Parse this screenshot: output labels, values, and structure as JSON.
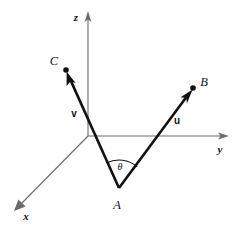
{
  "figure": {
    "kind": "3d-vector-diagram",
    "background_color": "#ffffff",
    "ink_color": "#111111",
    "axis_color": "#6b6b6b",
    "width": 240,
    "height": 228
  },
  "axes": {
    "origin": {
      "x": 88,
      "y": 136
    },
    "z": {
      "label": "z",
      "label_x": 76,
      "label_y": 21,
      "from_x": 88,
      "from_y": 136,
      "to_x": 88,
      "to_y": 14
    },
    "y": {
      "label": "y",
      "label_x": 220,
      "label_y": 153,
      "from_x": 88,
      "from_y": 136,
      "to_x": 227,
      "to_y": 136
    },
    "x": {
      "label": "x",
      "label_x": 24,
      "label_y": 220,
      "from_x": 88,
      "from_y": 136,
      "to_x": 16,
      "to_y": 209
    }
  },
  "points": {
    "A": {
      "label": "A",
      "x": 119,
      "y": 188,
      "label_x": 113,
      "label_y": 208
    },
    "B": {
      "label": "B",
      "x": 193,
      "y": 88,
      "label_x": 200,
      "label_y": 86
    },
    "C": {
      "label": "C",
      "x": 66,
      "y": 70,
      "label_x": 53,
      "label_y": 65
    }
  },
  "vectors": [
    {
      "name": "u",
      "label": "u",
      "from_point": "A",
      "to_point": "B",
      "from_x": 119,
      "from_y": 188,
      "to_x": 193,
      "to_y": 88,
      "label_x": 176,
      "label_y": 125
    },
    {
      "name": "v",
      "label": "v",
      "from_point": "A",
      "to_point": "C",
      "from_x": 119,
      "from_y": 188,
      "to_x": 66,
      "to_y": 70,
      "label_x": 73,
      "label_y": 117
    }
  ],
  "angle": {
    "label": "θ",
    "label_x": 118,
    "label_y": 171,
    "vertex_x": 119,
    "vertex_y": 188,
    "radius": 28
  }
}
